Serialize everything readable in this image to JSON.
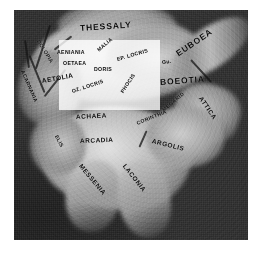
{
  "figure": {
    "kind": "relief-map",
    "background_color": "#ffffff",
    "map_tone": "grayscale",
    "highlight_overlay": {
      "name": "central-greece-highlight",
      "color": "#ffffff",
      "opacity": "0.80"
    }
  },
  "labels": [
    {
      "text": "THESSALY",
      "size": "big",
      "x": 66,
      "y": 14,
      "rot": -4,
      "onwhite": false
    },
    {
      "text": "DOLOPIA",
      "size": "sm",
      "x": 24,
      "y": 28,
      "rot": 58,
      "onwhite": false
    },
    {
      "text": "AENIANIA",
      "size": "sm",
      "x": 43,
      "y": 40,
      "rot": 0,
      "onwhite": true
    },
    {
      "text": "MALIA",
      "size": "sm",
      "x": 84,
      "y": 38,
      "rot": -40,
      "onwhite": true
    },
    {
      "text": "EP. LOCRIS",
      "size": "sm",
      "x": 103,
      "y": 47,
      "rot": -16,
      "onwhite": true
    },
    {
      "text": "Gu.",
      "size": "sm",
      "x": 148,
      "y": 50,
      "rot": -8,
      "onwhite": true
    },
    {
      "text": "OETAEA",
      "size": "sm",
      "x": 49,
      "y": 51,
      "rot": 0,
      "onwhite": true
    },
    {
      "text": "DORIS",
      "size": "sm",
      "x": 80,
      "y": 57,
      "rot": 0,
      "onwhite": true
    },
    {
      "text": "EUBOEA",
      "size": "big",
      "x": 163,
      "y": 40,
      "rot": -34,
      "onwhite": false
    },
    {
      "text": "AETOLIA",
      "size": "mid",
      "x": 28,
      "y": 68,
      "rot": -10,
      "onwhite": true
    },
    {
      "text": "OZ. LOCRIS",
      "size": "sm",
      "x": 58,
      "y": 79,
      "rot": -18,
      "onwhite": true
    },
    {
      "text": "PHOCIS",
      "size": "sm",
      "x": 108,
      "y": 80,
      "rot": -56,
      "onwhite": true
    },
    {
      "text": "BOEOTIA",
      "size": "big",
      "x": 146,
      "y": 68,
      "rot": -4,
      "onwhite": false
    },
    {
      "text": "ACARNANIA",
      "size": "sm",
      "x": 8,
      "y": 58,
      "rot": 66,
      "onwhite": false
    },
    {
      "text": "ATTICA",
      "size": "mid",
      "x": 186,
      "y": 84,
      "rot": 56,
      "onwhite": false
    },
    {
      "text": "ACHAEA",
      "size": "mid",
      "x": 62,
      "y": 104,
      "rot": -3,
      "onwhite": false
    },
    {
      "text": "MEGARID",
      "size": "sm",
      "x": 149,
      "y": 98,
      "rot": -40,
      "onwhite": false
    },
    {
      "text": "CORINTHIA",
      "size": "sm",
      "x": 123,
      "y": 111,
      "rot": -22,
      "onwhite": false
    },
    {
      "text": "ELIS",
      "size": "sm",
      "x": 42,
      "y": 123,
      "rot": 62,
      "onwhite": false
    },
    {
      "text": "ARCADIA",
      "size": "mid",
      "x": 66,
      "y": 128,
      "rot": -2,
      "onwhite": false
    },
    {
      "text": "ARGOLIS",
      "size": "mid",
      "x": 138,
      "y": 128,
      "rot": 14,
      "onwhite": false
    },
    {
      "text": "MESSENIA",
      "size": "mid",
      "x": 66,
      "y": 152,
      "rot": 50,
      "onwhite": false
    },
    {
      "text": "LACONIA",
      "size": "mid",
      "x": 110,
      "y": 152,
      "rot": 52,
      "onwhite": false
    }
  ]
}
